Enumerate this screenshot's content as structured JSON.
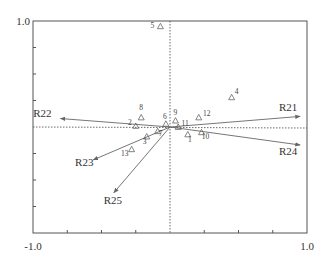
{
  "chart_data": {
    "type": "scatter",
    "subtype": "biplot",
    "title": "",
    "xlabel": "",
    "ylabel": "",
    "xlim": [
      -1.0,
      1.0
    ],
    "ylim": [
      -1.0,
      1.0
    ],
    "x_tick_labels": [
      "-1.0",
      "1.0"
    ],
    "y_tick_labels": [
      "1.0"
    ],
    "grid": false,
    "zero_lines": "dotted",
    "points": [
      {
        "label": "1",
        "x": 0.13,
        "y": -0.07
      },
      {
        "label": "2",
        "x": -0.25,
        "y": 0.01
      },
      {
        "label": "3",
        "x": -0.17,
        "y": -0.09
      },
      {
        "label": "4",
        "x": 0.45,
        "y": 0.28
      },
      {
        "label": "5",
        "x": -0.07,
        "y": 0.95
      },
      {
        "label": "6",
        "x": -0.03,
        "y": 0.03
      },
      {
        "label": "7",
        "x": -0.09,
        "y": -0.04
      },
      {
        "label": "8",
        "x": -0.21,
        "y": 0.09
      },
      {
        "label": "9",
        "x": 0.04,
        "y": 0.06
      },
      {
        "label": "10",
        "x": 0.23,
        "y": -0.05
      },
      {
        "label": "11",
        "x": 0.06,
        "y": 0.0
      },
      {
        "label": "12",
        "x": 0.21,
        "y": 0.09
      },
      {
        "label": "13",
        "x": -0.28,
        "y": -0.21
      }
    ],
    "vectors": [
      {
        "label": "R21",
        "x": 0.95,
        "y": 0.1
      },
      {
        "label": "R22",
        "x": -0.8,
        "y": 0.08
      },
      {
        "label": "R23",
        "x": -0.56,
        "y": -0.31
      },
      {
        "label": "R24",
        "x": 0.95,
        "y": -0.17
      },
      {
        "label": "R25",
        "x": -0.41,
        "y": -0.62
      }
    ],
    "marker": "triangle-open"
  },
  "colors": {
    "axis": "#555555",
    "marker": "#666666",
    "arrow": "#666666",
    "text": "#333333"
  }
}
